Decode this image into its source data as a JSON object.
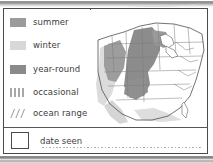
{
  "card": {
    "legend": {
      "items": [
        {
          "label": "summer",
          "swatch": "solid-medium-gray",
          "color": "#9b9b9b"
        },
        {
          "label": "winter",
          "swatch": "solid-light-gray",
          "color": "#d8d8d8"
        },
        {
          "label": "year-round",
          "swatch": "solid-dark-gray",
          "color": "#8a8a8a"
        },
        {
          "label": "occasional",
          "swatch": "dotted-grid",
          "color": "#a8a8a8"
        },
        {
          "label": "ocean range",
          "swatch": "diagonal-hatch",
          "color": "#9e9e9e"
        }
      ]
    },
    "date_seen": {
      "label": "date seen",
      "checkbox_checked": "",
      "write_in_value": ""
    },
    "map": {
      "name": "range-map-united-states",
      "regions": [
        {
          "name": "great-plains-year-round",
          "fill": "#8a8a8a"
        },
        {
          "name": "great-basin-summer",
          "fill": "#9b9b9b"
        },
        {
          "name": "pacific-coast-winter",
          "fill": "#d9d9d9"
        },
        {
          "name": "gulf-coast-winter",
          "fill": "#dcdcdc"
        }
      ]
    }
  },
  "colors": {
    "ink": "#3d3d3d",
    "border": "#4a4a4a",
    "summer": "#9b9b9b",
    "winter": "#d8d8d8",
    "year_round": "#8a8a8a",
    "occasional": "#a8a8a8",
    "ocean_range": "#9e9e9e"
  }
}
